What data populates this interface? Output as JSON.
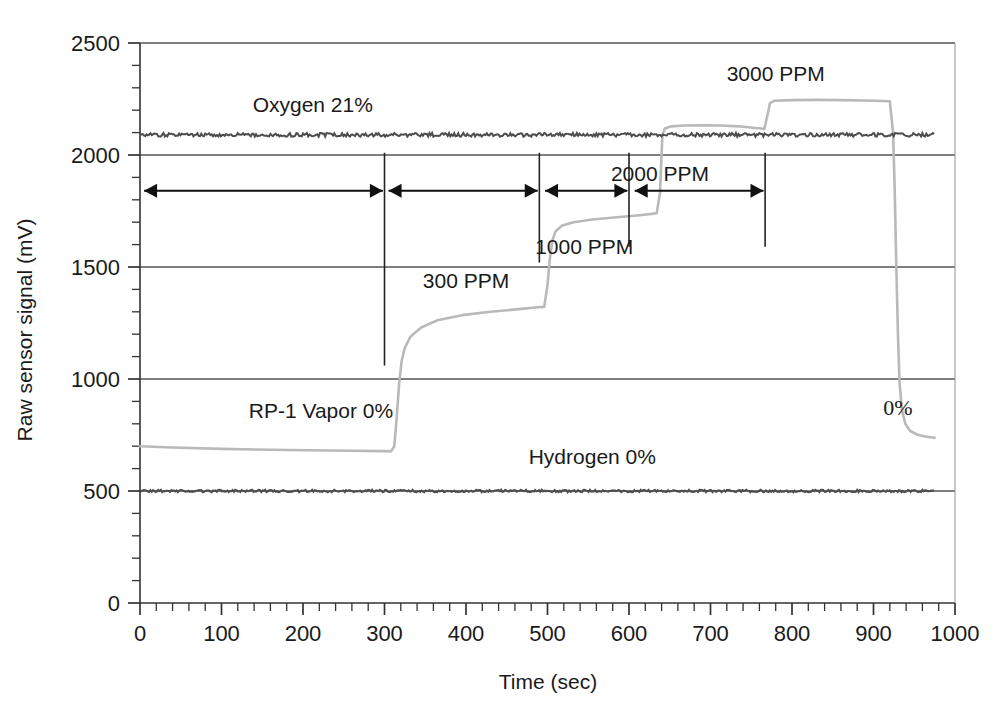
{
  "chart_data": {
    "type": "line",
    "title": "",
    "xlabel": "Time (sec)",
    "ylabel": "Raw sensor signal (mV)",
    "xlim": [
      0,
      1000
    ],
    "ylim": [
      0,
      2500
    ],
    "xticks": [
      0,
      100,
      200,
      300,
      400,
      500,
      600,
      700,
      800,
      900,
      1000
    ],
    "yticks": [
      0,
      500,
      1000,
      1500,
      2000,
      2500
    ],
    "x_minor_tick_step": 20,
    "y_minor_tick_step": 100,
    "grid": "horizontal-major",
    "legend": "inline-annotations",
    "series": [
      {
        "name": "RP-1 Vapor sensor",
        "color": "#b9b9b9",
        "points": [
          [
            0,
            700
          ],
          [
            40,
            694
          ],
          [
            100,
            688
          ],
          [
            180,
            683
          ],
          [
            260,
            680
          ],
          [
            300,
            678
          ],
          [
            308,
            677
          ],
          [
            312,
            700
          ],
          [
            315,
            830
          ],
          [
            318,
            980
          ],
          [
            321,
            1080
          ],
          [
            325,
            1140
          ],
          [
            332,
            1190
          ],
          [
            345,
            1230
          ],
          [
            365,
            1262
          ],
          [
            395,
            1285
          ],
          [
            430,
            1300
          ],
          [
            465,
            1312
          ],
          [
            488,
            1320
          ],
          [
            496,
            1322
          ],
          [
            500,
            1420
          ],
          [
            503,
            1540
          ],
          [
            506,
            1620
          ],
          [
            510,
            1660
          ],
          [
            518,
            1685
          ],
          [
            532,
            1700
          ],
          [
            555,
            1712
          ],
          [
            585,
            1722
          ],
          [
            610,
            1730
          ],
          [
            628,
            1737
          ],
          [
            634,
            1740
          ],
          [
            638,
            1830
          ],
          [
            641,
            2090
          ],
          [
            644,
            2118
          ],
          [
            652,
            2128
          ],
          [
            668,
            2132
          ],
          [
            690,
            2133
          ],
          [
            712,
            2132
          ],
          [
            735,
            2128
          ],
          [
            752,
            2122
          ],
          [
            762,
            2118
          ],
          [
            766,
            2116
          ],
          [
            770,
            2180
          ],
          [
            773,
            2232
          ],
          [
            778,
            2242
          ],
          [
            800,
            2245
          ],
          [
            830,
            2246
          ],
          [
            860,
            2245
          ],
          [
            890,
            2243
          ],
          [
            912,
            2241
          ],
          [
            920,
            2240
          ],
          [
            924,
            2100
          ],
          [
            926,
            1850
          ],
          [
            928,
            1500
          ],
          [
            930,
            1200
          ],
          [
            932,
            980
          ],
          [
            935,
            860
          ],
          [
            939,
            800
          ],
          [
            945,
            768
          ],
          [
            955,
            750
          ],
          [
            965,
            742
          ],
          [
            975,
            738
          ]
        ]
      },
      {
        "name": "Oxygen sensor",
        "color": "#4d4d4d",
        "level": 2090,
        "x_start": 0,
        "x_end": 975,
        "noise": 9
      },
      {
        "name": "Hydrogen sensor",
        "color": "#4d4d4d",
        "level": 500,
        "x_start": 0,
        "x_end": 975,
        "noise": 6
      }
    ],
    "annotations": [
      {
        "name": "oxygen-label",
        "text": "Oxygen 21%",
        "x": 212,
        "y": 2190,
        "style": "sans"
      },
      {
        "name": "rp1-label",
        "text": "RP-1 Vapor 0%",
        "x": 222,
        "y": 825,
        "style": "sans"
      },
      {
        "name": "hydrogen-label",
        "text": "Hydrogen 0%",
        "x": 555,
        "y": 620,
        "style": "sans"
      },
      {
        "name": "ppm-300-label",
        "text": "300 PPM",
        "x": 400,
        "y": 1405,
        "style": "sans"
      },
      {
        "name": "ppm-1000-label",
        "text": "1000 PPM",
        "x": 545,
        "y": 1560,
        "style": "sans"
      },
      {
        "name": "ppm-2000-label",
        "text": "2000 PPM",
        "x": 638,
        "y": 1885,
        "style": "sans"
      },
      {
        "name": "ppm-3000-label",
        "text": "3000 PPM",
        "x": 780,
        "y": 2330,
        "style": "sans"
      },
      {
        "name": "zero-percent-label",
        "text": "0%",
        "x": 930,
        "y": 840,
        "style": "serif"
      }
    ],
    "dividers": [
      {
        "name": "divider-300s",
        "x": 300,
        "y0": 1060,
        "y1": 2010
      },
      {
        "name": "divider-490s",
        "x": 490,
        "y0": 1520,
        "y1": 2010
      },
      {
        "name": "divider-600s",
        "x": 600,
        "y0": 1590,
        "y1": 2010
      },
      {
        "name": "divider-767s",
        "x": 767,
        "y0": 1590,
        "y1": 2010
      }
    ],
    "range_arrows": [
      {
        "name": "arrow-range-0-300",
        "x0": 5,
        "x1": 298,
        "y": 1840
      },
      {
        "name": "arrow-range-300-490",
        "x0": 305,
        "x1": 488,
        "y": 1840
      },
      {
        "name": "arrow-range-490-600",
        "x0": 497,
        "x1": 598,
        "y": 1840
      },
      {
        "name": "arrow-range-600-767",
        "x0": 607,
        "x1": 765,
        "y": 1840
      }
    ]
  }
}
